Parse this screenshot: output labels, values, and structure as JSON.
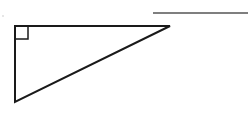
{
  "diagram": {
    "type": "right-triangle",
    "stroke_color": "#1a1a1a",
    "line_color": "#555555",
    "vertices": {
      "top_left": [
        15,
        26
      ],
      "top_right": [
        170,
        26
      ],
      "bottom_left": [
        15,
        102
      ]
    },
    "right_angle_marker": {
      "x": 15,
      "y": 26,
      "size": 13
    },
    "answer_line": {
      "x1": 153,
      "y1": 13,
      "x2": 248,
      "y2": 13
    }
  }
}
